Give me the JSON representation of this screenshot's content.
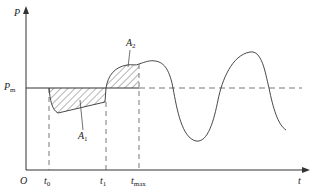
{
  "diagram": {
    "type": "power-angle-time curve",
    "axes": {
      "y_label": "P",
      "x_label": "t",
      "origin": "O"
    },
    "reference_line": {
      "label_main": "P",
      "label_sub": "m"
    },
    "time_marks": [
      {
        "main": "t",
        "sub": "0"
      },
      {
        "main": "t",
        "sub": "1"
      },
      {
        "main": "t",
        "sub": "max"
      }
    ],
    "areas": [
      {
        "main": "A",
        "sub": "1"
      },
      {
        "main": "A",
        "sub": "2"
      }
    ],
    "colors": {
      "line": "#333333",
      "background": "#ffffff"
    }
  }
}
